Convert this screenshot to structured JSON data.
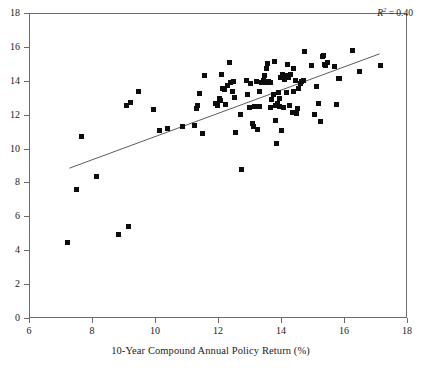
{
  "chart_data": {
    "type": "scatter",
    "title": "",
    "xlabel": "10-Year Compound Annual Policy Return (%)",
    "ylabel": "",
    "xlim": [
      6,
      18
    ],
    "ylim": [
      0,
      18
    ],
    "xticks": [
      6,
      8,
      10,
      12,
      14,
      16,
      18
    ],
    "yticks": [
      0,
      2,
      4,
      6,
      8,
      10,
      12,
      14,
      16,
      18
    ],
    "grid": false,
    "legend": null,
    "annotations": [
      {
        "name": "r-squared",
        "text": "R2 = 0.40",
        "value": 0.4,
        "position": "top-right"
      }
    ],
    "marker": {
      "shape": "square",
      "color": "#0d0d0d",
      "size": 5
    },
    "trendline": {
      "type": "linear",
      "color": "#4a4a4a",
      "x": [
        7.25,
        17.1
      ],
      "y": [
        8.9,
        15.65
      ]
    },
    "points": [
      [
        7.18,
        4.52
      ],
      [
        7.48,
        7.67
      ],
      [
        7.63,
        10.8
      ],
      [
        8.12,
        8.42
      ],
      [
        8.82,
        4.98
      ],
      [
        9.12,
        5.48
      ],
      [
        9.05,
        12.62
      ],
      [
        9.18,
        12.78
      ],
      [
        9.45,
        13.45
      ],
      [
        9.92,
        12.38
      ],
      [
        10.12,
        11.1
      ],
      [
        10.38,
        11.25
      ],
      [
        10.85,
        11.38
      ],
      [
        11.22,
        11.4
      ],
      [
        11.28,
        12.42
      ],
      [
        11.32,
        12.58
      ],
      [
        11.38,
        13.32
      ],
      [
        11.48,
        10.92
      ],
      [
        11.55,
        14.35
      ],
      [
        11.9,
        12.72
      ],
      [
        12.0,
        13.02
      ],
      [
        12.05,
        12.88
      ],
      [
        12.08,
        14.42
      ],
      [
        12.2,
        12.68
      ],
      [
        12.28,
        13.78
      ],
      [
        12.32,
        15.15
      ],
      [
        12.35,
        13.98
      ],
      [
        12.42,
        13.42
      ],
      [
        12.48,
        13.1
      ],
      [
        12.52,
        11.02
      ],
      [
        12.68,
        12.05
      ],
      [
        12.72,
        8.82
      ],
      [
        12.9,
        13.25
      ],
      [
        12.98,
        12.48
      ],
      [
        13.0,
        13.88
      ],
      [
        13.05,
        11.52
      ],
      [
        13.08,
        11.38
      ],
      [
        13.12,
        12.52
      ],
      [
        13.18,
        14.02
      ],
      [
        13.22,
        11.18
      ],
      [
        13.3,
        12.55
      ],
      [
        13.35,
        13.98
      ],
      [
        13.4,
        14.05
      ],
      [
        13.45,
        14.38
      ],
      [
        13.48,
        13.95
      ],
      [
        13.52,
        14.78
      ],
      [
        13.55,
        15.08
      ],
      [
        13.58,
        14.02
      ],
      [
        13.62,
        13.98
      ],
      [
        13.68,
        12.98
      ],
      [
        13.72,
        13.25
      ],
      [
        13.75,
        15.18
      ],
      [
        13.78,
        12.62
      ],
      [
        13.8,
        11.72
      ],
      [
        13.82,
        10.38
      ],
      [
        13.85,
        12.72
      ],
      [
        13.88,
        13.38
      ],
      [
        13.92,
        12.52
      ],
      [
        13.95,
        14.28
      ],
      [
        13.98,
        11.12
      ],
      [
        14.02,
        14.42
      ],
      [
        14.05,
        12.48
      ],
      [
        14.08,
        14.12
      ],
      [
        14.12,
        14.35
      ],
      [
        14.18,
        15.02
      ],
      [
        14.22,
        14.28
      ],
      [
        14.25,
        12.62
      ],
      [
        14.28,
        14.42
      ],
      [
        14.32,
        12.18
      ],
      [
        14.38,
        14.78
      ],
      [
        14.42,
        14.05
      ],
      [
        14.45,
        12.12
      ],
      [
        14.48,
        12.42
      ],
      [
        14.52,
        13.58
      ],
      [
        14.58,
        13.92
      ],
      [
        14.62,
        14.02
      ],
      [
        14.72,
        15.78
      ],
      [
        14.95,
        14.95
      ],
      [
        15.02,
        12.08
      ],
      [
        15.08,
        13.72
      ],
      [
        15.15,
        12.7
      ],
      [
        15.22,
        11.68
      ],
      [
        15.28,
        15.52
      ],
      [
        15.32,
        15.58
      ],
      [
        15.35,
        15.02
      ],
      [
        15.38,
        14.98
      ],
      [
        15.68,
        14.88
      ],
      [
        15.72,
        12.68
      ],
      [
        15.78,
        14.22
      ],
      [
        15.82,
        14.18
      ],
      [
        16.25,
        15.82
      ],
      [
        16.45,
        14.58
      ],
      [
        17.12,
        14.98
      ],
      [
        12.12,
        13.62
      ],
      [
        12.18,
        13.52
      ],
      [
        11.95,
        12.62
      ],
      [
        13.92,
        13.02
      ],
      [
        14.15,
        13.35
      ],
      [
        12.45,
        14.02
      ],
      [
        13.28,
        13.42
      ],
      [
        14.68,
        14.05
      ],
      [
        13.65,
        12.48
      ],
      [
        12.88,
        14.08
      ],
      [
        14.35,
        13.45
      ],
      [
        15.45,
        15.12
      ]
    ]
  }
}
